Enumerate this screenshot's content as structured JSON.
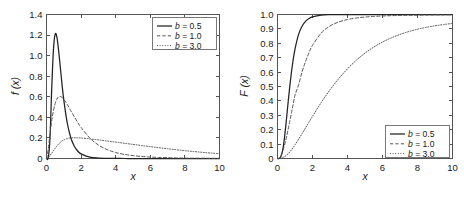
{
  "figure": {
    "background": "#ffffff",
    "panels": [
      "pdf",
      "cdf"
    ]
  },
  "chart_data": [
    {
      "type": "line",
      "panel": "left",
      "title": "",
      "xlabel": "x",
      "ylabel": "f (x)",
      "xlim": [
        0,
        10
      ],
      "ylim": [
        0,
        1.4
      ],
      "xticks": [
        "0",
        "2",
        "4",
        "6",
        "8",
        "10"
      ],
      "xtick_values": [
        0,
        2,
        4,
        6,
        8,
        10
      ],
      "yticks": [
        "0",
        "0.2",
        "0.4",
        "0.6",
        "0.8",
        "1.0",
        "1.2",
        "1.4"
      ],
      "ytick_values": [
        0,
        0.2,
        0.4,
        0.6,
        0.8,
        1.0,
        1.2,
        1.4
      ],
      "grid": false,
      "legend_position": "upper-right",
      "x": [
        0.0,
        0.1,
        0.2,
        0.3,
        0.4,
        0.5,
        0.6,
        0.7,
        0.8,
        0.9,
        1.0,
        1.2,
        1.4,
        1.6,
        1.8,
        2.0,
        2.5,
        3.0,
        3.5,
        4.0,
        4.5,
        5.0,
        5.5,
        6.0,
        6.5,
        7.0,
        7.5,
        8.0,
        8.5,
        9.0,
        9.5,
        10.0
      ],
      "series": [
        {
          "name": "b = 0.5",
          "style": "solid",
          "values": [
            0.0,
            0.006,
            0.193,
            0.672,
            1.054,
            1.209,
            1.18,
            1.05,
            0.883,
            0.716,
            0.568,
            0.345,
            0.204,
            0.121,
            0.073,
            0.045,
            0.013,
            0.004,
            0.002,
            0.001,
            0.0,
            0.0,
            0.0,
            0.0,
            0.0,
            0.0,
            0.0,
            0.0,
            0.0,
            0.0,
            0.0,
            0.0
          ]
        },
        {
          "name": "b = 1.0",
          "style": "dashed",
          "values": [
            0.0,
            0.09,
            0.237,
            0.365,
            0.463,
            0.534,
            0.578,
            0.599,
            0.603,
            0.594,
            0.576,
            0.525,
            0.466,
            0.408,
            0.352,
            0.302,
            0.2,
            0.131,
            0.087,
            0.058,
            0.04,
            0.028,
            0.02,
            0.014,
            0.01,
            0.008,
            0.006,
            0.004,
            0.003,
            0.003,
            0.002,
            0.002
          ]
        },
        {
          "name": "b = 3.0",
          "style": "dotted",
          "values": [
            0.0,
            0.009,
            0.028,
            0.051,
            0.075,
            0.099,
            0.121,
            0.141,
            0.157,
            0.171,
            0.181,
            0.194,
            0.2,
            0.202,
            0.201,
            0.199,
            0.191,
            0.181,
            0.17,
            0.159,
            0.148,
            0.137,
            0.126,
            0.115,
            0.105,
            0.095,
            0.085,
            0.076,
            0.068,
            0.06,
            0.053,
            0.047
          ]
        }
      ]
    },
    {
      "type": "line",
      "panel": "right",
      "title": "",
      "xlabel": "x",
      "ylabel": "F (x)",
      "xlim": [
        0,
        10
      ],
      "ylim": [
        0,
        1.0
      ],
      "xticks": [
        "0",
        "2",
        "4",
        "6",
        "8",
        "10"
      ],
      "xtick_values": [
        0,
        2,
        4,
        6,
        8,
        10
      ],
      "yticks": [
        "0",
        "0.1",
        "0.2",
        "0.3",
        "0.4",
        "0.5",
        "0.6",
        "0.7",
        "0.8",
        "0.9",
        "1.0"
      ],
      "ytick_values": [
        0,
        0.1,
        0.2,
        0.3,
        0.4,
        0.5,
        0.6,
        0.7,
        0.8,
        0.9,
        1.0
      ],
      "grid": false,
      "legend_position": "lower-right",
      "x": [
        0.0,
        0.1,
        0.2,
        0.3,
        0.4,
        0.5,
        0.6,
        0.7,
        0.8,
        0.9,
        1.0,
        1.2,
        1.4,
        1.6,
        1.8,
        2.0,
        2.5,
        3.0,
        3.5,
        4.0,
        4.5,
        5.0,
        5.5,
        6.0,
        6.5,
        7.0,
        7.5,
        8.0,
        8.5,
        9.0,
        9.5,
        10.0
      ],
      "series": [
        {
          "name": "b = 0.5",
          "style": "solid",
          "values": [
            0.0,
            0.0001,
            0.0151,
            0.0597,
            0.1449,
            0.2587,
            0.3816,
            0.4988,
            0.6022,
            0.6892,
            0.7602,
            0.86,
            0.9184,
            0.9522,
            0.9716,
            0.983,
            0.9953,
            0.9987,
            0.9996,
            0.9999,
            1.0,
            1.0,
            1.0,
            1.0,
            1.0,
            1.0,
            1.0,
            1.0,
            1.0,
            1.0,
            1.0,
            1.0
          ]
        },
        {
          "name": "b = 1.0",
          "style": "dashed",
          "values": [
            0.0,
            0.0032,
            0.0199,
            0.0503,
            0.0918,
            0.1418,
            0.1977,
            0.2572,
            0.3183,
            0.3794,
            0.4392,
            0.5098,
            0.5992,
            0.6726,
            0.7341,
            0.7856,
            0.8715,
            0.9199,
            0.9481,
            0.965,
            0.9755,
            0.9822,
            0.9866,
            0.9897,
            0.9919,
            0.9934,
            0.9946,
            0.9955,
            0.9962,
            0.9968,
            0.9972,
            0.9976
          ]
        },
        {
          "name": "b = 3.0",
          "style": "dotted",
          "values": [
            0.0,
            0.0004,
            0.0022,
            0.0061,
            0.0124,
            0.0212,
            0.0322,
            0.0454,
            0.0603,
            0.0767,
            0.0944,
            0.1325,
            0.172,
            0.2122,
            0.2525,
            0.2925,
            0.3888,
            0.4767,
            0.5549,
            0.6231,
            0.6818,
            0.7317,
            0.7736,
            0.8086,
            0.8376,
            0.8616,
            0.8813,
            0.8975,
            0.9108,
            0.9216,
            0.9305,
            0.9378
          ]
        }
      ]
    }
  ],
  "legend_left": {
    "items": [
      {
        "var": "b",
        "text": " = 0.5",
        "style": "solid"
      },
      {
        "var": "b",
        "text": " = 1.0",
        "style": "dashed"
      },
      {
        "var": "b",
        "text": " = 3.0",
        "style": "dotted"
      }
    ]
  },
  "legend_right": {
    "items": [
      {
        "var": "b",
        "text": " = 0.5",
        "style": "solid"
      },
      {
        "var": "b",
        "text": " = 1.0",
        "style": "dashed"
      },
      {
        "var": "b",
        "text": " = 3.0",
        "style": "dotted"
      }
    ]
  }
}
